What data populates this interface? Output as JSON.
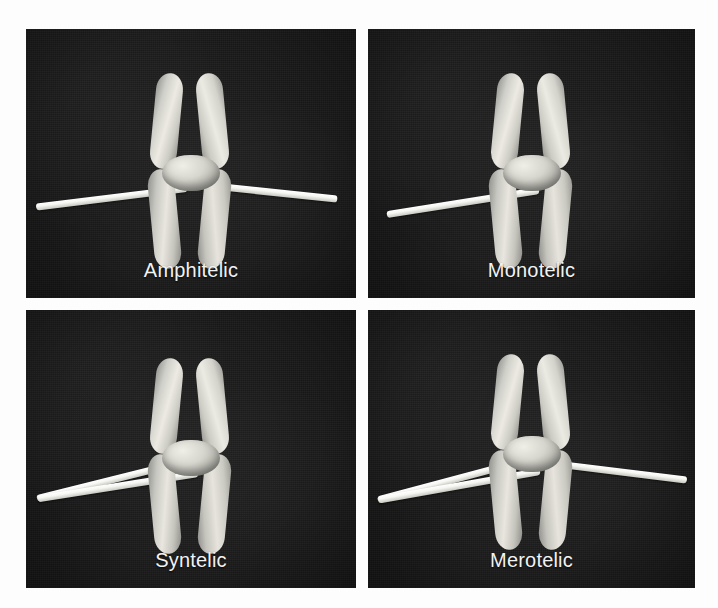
{
  "figure": {
    "background_color": "#fdfdfd",
    "panel_background_color": "#191919",
    "caption_color": "#f2f2f2",
    "microtubule_color": "#ffffff",
    "chromosome_color": "#e8e7df"
  },
  "panels": [
    {
      "id": "amphitelic",
      "label": "Amphitelic",
      "position": "top-left",
      "microtubule_count": 2,
      "attachment": "each sister kinetochore bound by microtubules from opposite poles",
      "microtubules": [
        {
          "side": "left",
          "length": 148,
          "angle": -7.0,
          "y": 120
        },
        {
          "side": "right",
          "length": 140,
          "angle": 6.0,
          "y": 118
        }
      ]
    },
    {
      "id": "monotelic",
      "label": "Monotelic",
      "position": "top-right",
      "microtubule_count": 1,
      "attachment": "only one sister kinetochore attached, to a single pole",
      "microtubules": [
        {
          "side": "left",
          "length": 150,
          "angle": -9.0,
          "y": 118
        }
      ]
    },
    {
      "id": "syntelic",
      "label": "Syntelic",
      "position": "bottom-left",
      "microtubule_count": 2,
      "attachment": "both sister kinetochores attached to the same pole",
      "microtubules": [
        {
          "side": "left",
          "length": 165,
          "angle": -14.0,
          "y": 110
        },
        {
          "side": "left",
          "length": 158,
          "angle": -9.0,
          "y": 126
        }
      ]
    },
    {
      "id": "merotelic",
      "label": "Merotelic",
      "position": "bottom-right",
      "microtubule_count": 3,
      "attachment": "one kinetochore attached to both poles",
      "microtubules": [
        {
          "side": "left",
          "length": 168,
          "angle": -15.0,
          "y": 108
        },
        {
          "side": "left",
          "length": 160,
          "angle": -10.0,
          "y": 124
        },
        {
          "side": "right",
          "length": 152,
          "angle": 7.0,
          "y": 120
        }
      ]
    }
  ]
}
